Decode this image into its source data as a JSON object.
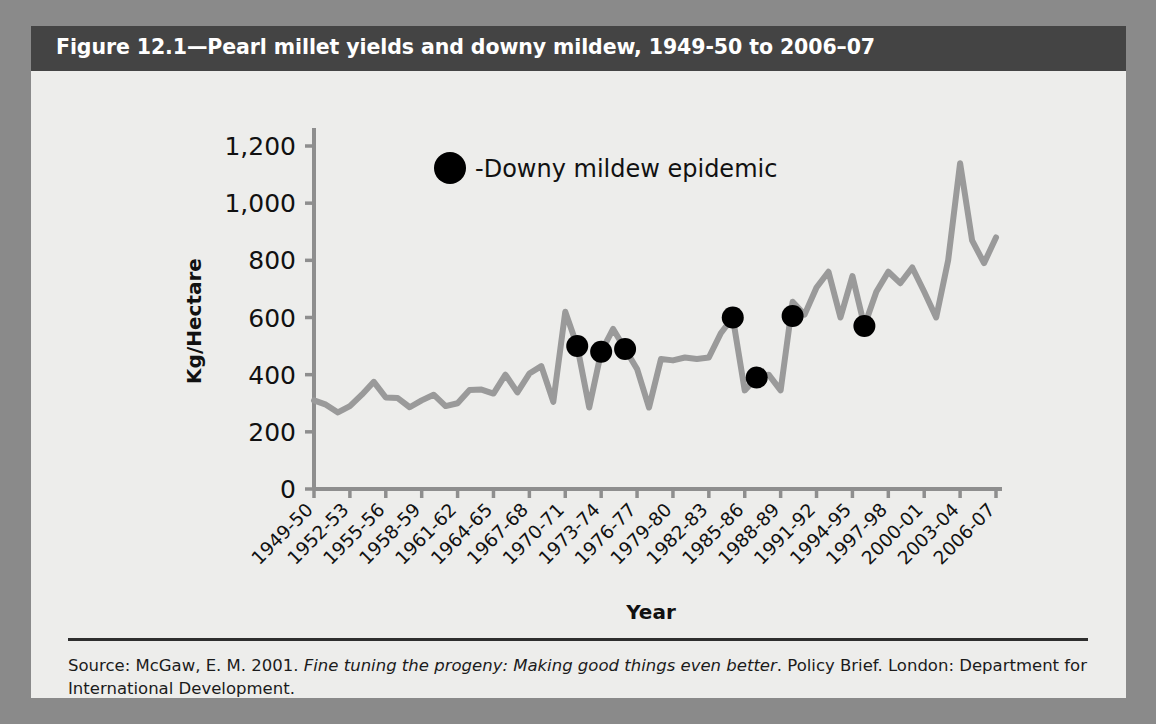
{
  "figure": {
    "title": "Figure 12.1—Pearl millet yields and downy mildew, 1949-50 to 2006–07",
    "source_prefix": "Source: McGaw, E. M. 2001. ",
    "source_italic": "Fine tuning the progeny: Making good things even better",
    "source_suffix": ". Policy Brief. London: Department for International Development."
  },
  "colors": {
    "page_background": "#8a8a8a",
    "figure_background": "#ededeb",
    "title_bar": "#444444",
    "title_text": "#ffffff",
    "line": "#9a9a9a",
    "axis": "#8e8e8e",
    "marker": "#000000"
  },
  "legend": {
    "marker_shape": "filled-circle",
    "label": "-Downy mildew epidemic"
  },
  "chart_data": {
    "type": "line",
    "title": "Figure 12.1—Pearl millet yields and downy mildew, 1949-50 to 2006–07",
    "xlabel": "Year",
    "ylabel": "Kg/Hectare",
    "ylim": [
      0,
      1200
    ],
    "yticks": [
      0,
      200,
      400,
      600,
      800,
      1000,
      1200
    ],
    "ytick_labels": [
      "0",
      "200",
      "400",
      "600",
      "800",
      "1,000",
      "1,200"
    ],
    "grid": false,
    "legend_position": "top-center",
    "x_tick_every": 3,
    "xtick_labels": [
      "1949-50",
      "1952-53",
      "1955-56",
      "1958-59",
      "1961-62",
      "1964-65",
      "1967-68",
      "1970-71",
      "1973-74",
      "1976-77",
      "1979-80",
      "1982-83",
      "1985-86",
      "1988-89",
      "1991-92",
      "1994-95",
      "1997-98",
      "2000-01",
      "2003-04",
      "2006-07"
    ],
    "x": [
      "1949-50",
      "1950-51",
      "1951-52",
      "1952-53",
      "1953-54",
      "1954-55",
      "1955-56",
      "1956-57",
      "1957-58",
      "1958-59",
      "1959-60",
      "1960-61",
      "1961-62",
      "1962-63",
      "1963-64",
      "1964-65",
      "1965-66",
      "1966-67",
      "1967-68",
      "1968-69",
      "1969-70",
      "1970-71",
      "1971-72",
      "1972-73",
      "1973-74",
      "1974-75",
      "1975-76",
      "1976-77",
      "1977-78",
      "1978-79",
      "1979-80",
      "1980-81",
      "1981-82",
      "1982-83",
      "1983-84",
      "1984-85",
      "1985-86",
      "1986-87",
      "1987-88",
      "1988-89",
      "1989-90",
      "1990-91",
      "1991-92",
      "1992-93",
      "1993-94",
      "1994-95",
      "1995-96",
      "1996-97",
      "1997-98",
      "1998-99",
      "1999-00",
      "2000-01",
      "2001-02",
      "2002-03",
      "2003-04",
      "2004-05",
      "2005-06",
      "2006-07"
    ],
    "series": [
      {
        "name": "Pearl millet yield",
        "units": "Kg/Hectare",
        "values": [
          310,
          295,
          268,
          290,
          330,
          375,
          320,
          318,
          286,
          310,
          330,
          290,
          300,
          346,
          348,
          334,
          400,
          338,
          404,
          430,
          305,
          620,
          500,
          285,
          480,
          560,
          490,
          420,
          285,
          455,
          450,
          460,
          455,
          460,
          545,
          600,
          345,
          390,
          400,
          345,
          655,
          610,
          705,
          760,
          600,
          745,
          570,
          690,
          760,
          720,
          775,
          690,
          600,
          800,
          1140,
          870,
          790,
          880
        ]
      }
    ],
    "epidemic_markers": [
      {
        "x": "1971-72",
        "y": 500
      },
      {
        "x": "1973-74",
        "y": 480
      },
      {
        "x": "1975-76",
        "y": 490
      },
      {
        "x": "1984-85",
        "y": 600
      },
      {
        "x": "1986-87",
        "y": 390
      },
      {
        "x": "1989-90",
        "y": 605
      },
      {
        "x": "1995-96",
        "y": 570
      }
    ]
  }
}
